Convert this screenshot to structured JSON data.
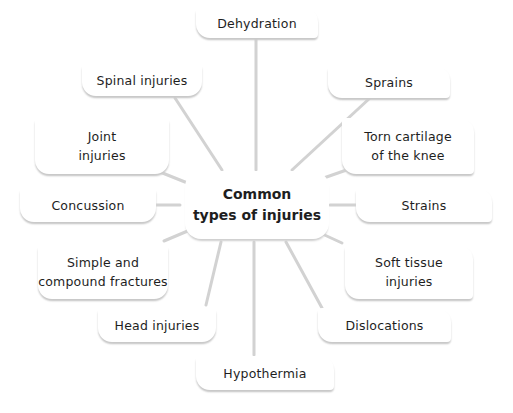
{
  "diagram": {
    "type": "mind-map",
    "center": {
      "label": "Common\ntypes of injuries"
    },
    "nodes": [
      {
        "id": "dehydration",
        "label": "Dehydration"
      },
      {
        "id": "spinal",
        "label": "Spinal injuries"
      },
      {
        "id": "sprains",
        "label": "Sprains"
      },
      {
        "id": "joint",
        "label": "Joint\ninjuries"
      },
      {
        "id": "torn-cartilage",
        "label": "Torn cartilage\nof the knee"
      },
      {
        "id": "concussion",
        "label": "Concussion"
      },
      {
        "id": "strains",
        "label": "Strains"
      },
      {
        "id": "fractures",
        "label": "Simple and\ncompound fractures"
      },
      {
        "id": "soft-tissue",
        "label": "Soft tissue\ninjuries"
      },
      {
        "id": "head",
        "label": "Head injuries"
      },
      {
        "id": "dislocations",
        "label": "Dislocations"
      },
      {
        "id": "hypothermia",
        "label": "Hypothermia"
      }
    ],
    "colors": {
      "connector": "#d0d0d0",
      "shadow": "#c9c9c9",
      "text": "#1e1e1e"
    }
  }
}
